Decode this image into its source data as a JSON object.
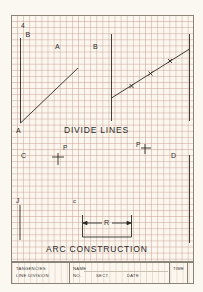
{
  "worksheet": {
    "sections": {
      "divide_lines": {
        "title": "DIVIDE LINES"
      },
      "arc_construction": {
        "title": "ARC CONSTRUCTION"
      }
    },
    "labels": {
      "num_4": "4",
      "b_left": "B",
      "a_top": "A",
      "b_mid": "B",
      "a_bottom": "A",
      "c": "C",
      "p_left": "P",
      "p_right": "P",
      "d": "D",
      "j": "J",
      "c_small": "c",
      "r": "R"
    },
    "title_block": {
      "subject_line1": "TANGENCIES",
      "subject_line2": "LINE DIVISION",
      "name_label": "NAME",
      "no_label": "NO.",
      "sect_label": "SECT",
      "date_label": "DATE",
      "time_label": "TIME"
    },
    "colors": {
      "paper": "#fbf7ef",
      "grid": "#c8a096",
      "ink": "#2c2a26"
    }
  }
}
